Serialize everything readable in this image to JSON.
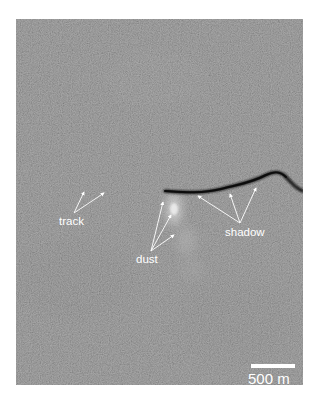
{
  "figure": {
    "labels": {
      "track": "track",
      "dust": "dust",
      "shadow": "shadow"
    },
    "scale_bar": {
      "label": "500 m"
    },
    "colors": {
      "terrain": "#7b7b7b",
      "shadow": "#111111",
      "annotation": "#ffffff"
    }
  }
}
